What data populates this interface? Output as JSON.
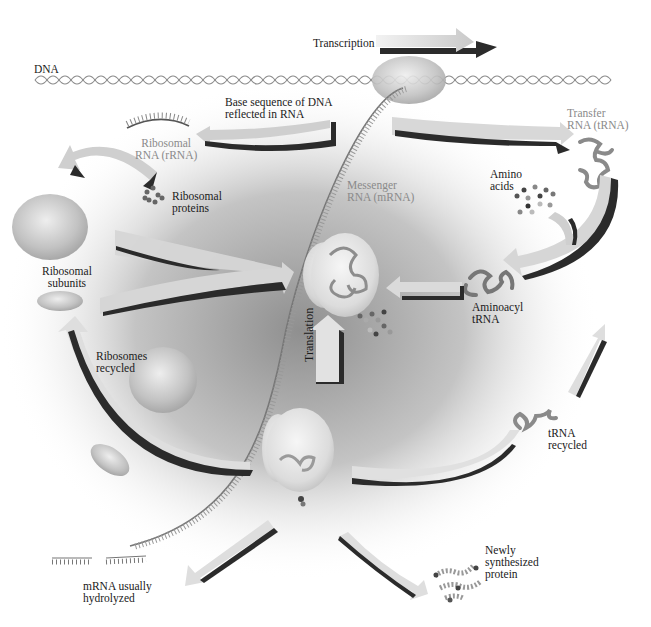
{
  "diagram": {
    "colors": {
      "arrow_face": "#d9d9d9",
      "arrow_shadow": "#2b2b2b",
      "cytoplasm_dark": "#9a9a9a",
      "ribosome": "#c8c8c8",
      "label": "#1a1a1a",
      "label_rna": "#8a8a8a"
    },
    "labels": {
      "dna": "DNA",
      "transcription": "Transcription",
      "base_sequence": "Base sequence of DNA\nreflected in RNA",
      "ribosomal_rna": "Ribosomal\nRNA (rRNA)",
      "transfer_rna": "Transfer\nRNA (tRNA)",
      "ribosomal_proteins": "Ribosomal\nproteins",
      "messenger_rna": "Messenger\nRNA (mRNA)",
      "amino_acids": "Amino\nacids",
      "ribosomal_subunits": "Ribosomal\nsubunits",
      "aminoacyl_trna": "Aminoacyl\ntRNA",
      "translation": "Translation",
      "ribosomes_recycled": "Ribosomes\nrecycled",
      "trna_recycled": "tRNA\nrecycled",
      "newly_synthesized_protein": "Newly\nsynthesized\nprotein",
      "mrna_hydrolyzed": "mRNA usually\nhydrolyzed"
    }
  }
}
